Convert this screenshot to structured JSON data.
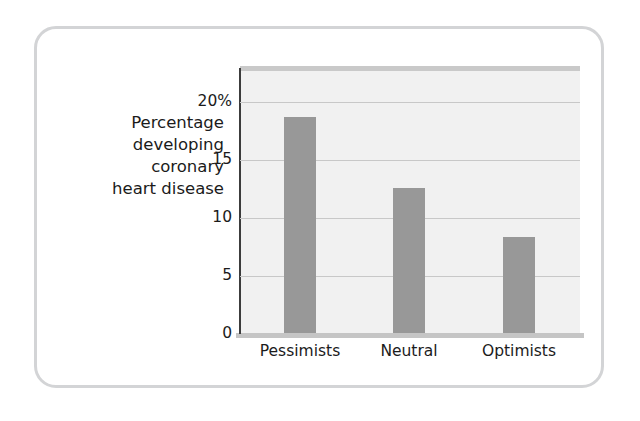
{
  "figure": {
    "frame_color": "#d3d4d6",
    "background": "#ffffff"
  },
  "chart_data": {
    "type": "bar",
    "title": "",
    "subtitle": "",
    "xlabel": "",
    "ylabel": "Percentage developing coronary heart disease",
    "ylabel_lines": [
      "Percentage",
      "developing",
      "coronary",
      "heart disease"
    ],
    "categories": [
      "Pessimists",
      "Neutral",
      "Optimists"
    ],
    "values": [
      17.5,
      11.8,
      7.8
    ],
    "ylim": [
      0,
      21.5
    ],
    "yticks": [
      0,
      5,
      10,
      15,
      20
    ],
    "ytick_labels": [
      "0",
      "5",
      "10",
      "15",
      "20%"
    ],
    "grid": true,
    "grid_axis": "y",
    "legend": false,
    "bar_color": "#989898",
    "plot_background": "#f1f1f1",
    "gridline_color": "#c8c8c8",
    "axis_color": "#3c3c3c",
    "text_color": "#1b1b1b"
  }
}
